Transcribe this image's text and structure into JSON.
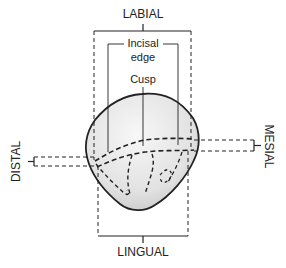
{
  "diagram": {
    "labels": {
      "top": "LABIAL",
      "bottom": "LINGUAL",
      "left": "DISTAL",
      "right": "MESIAL",
      "incisal_edge_line1": "Incisal",
      "incisal_edge_line2": "edge",
      "cusp": "Cusp"
    },
    "colors": {
      "line": "#222222",
      "tooth_fill_light": "#f4f4f4",
      "tooth_fill_dark": "#cfcfcf"
    }
  }
}
